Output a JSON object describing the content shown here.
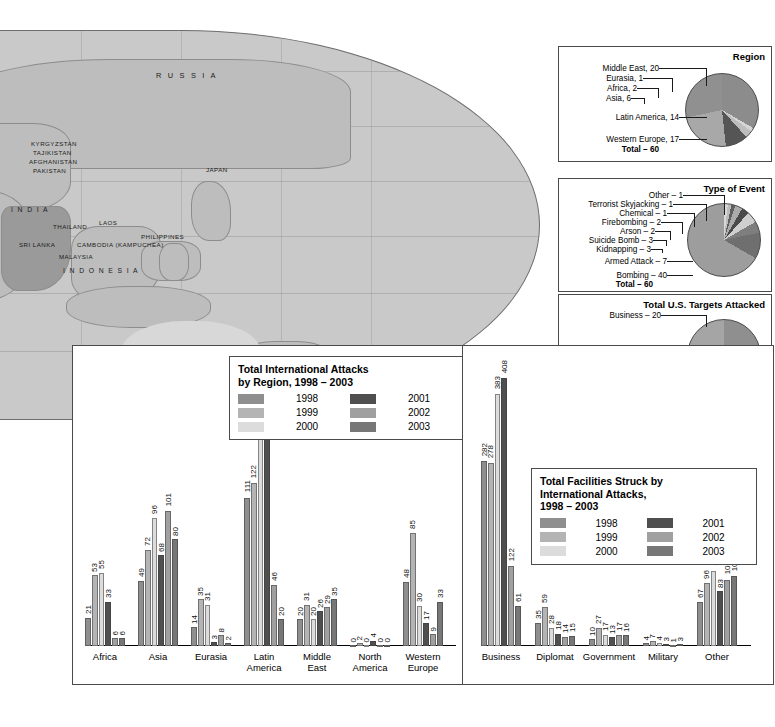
{
  "map": {
    "name": "world-map-eastern-hemisphere",
    "scale": {
      "miles": "2000 Miles",
      "kilometers": "3000 Kilometers"
    },
    "labels": [
      {
        "text": "RUSSIA",
        "x": 155,
        "y": 70,
        "cls": "big"
      },
      {
        "text": "BOSNIA AND",
        "x": -108,
        "y": 88,
        "cls": ""
      },
      {
        "text": "HERZEGOVINA",
        "x": -110,
        "y": 96,
        "cls": ""
      },
      {
        "text": "UKRAINE",
        "x": -106,
        "y": 109,
        "cls": ""
      },
      {
        "text": "YUGOSLAVIA",
        "x": -110,
        "y": 122,
        "cls": ""
      },
      {
        "text": "GREECE",
        "x": -104,
        "y": 135,
        "cls": ""
      },
      {
        "text": "GEORGIA",
        "x": -52,
        "y": 130,
        "cls": ""
      },
      {
        "text": "KYRGYZSTAN",
        "x": 30,
        "y": 139,
        "cls": ""
      },
      {
        "text": "TAJIKISTAN",
        "x": 32,
        "y": 148,
        "cls": ""
      },
      {
        "text": "AFGHANISTAN",
        "x": 28,
        "y": 157,
        "cls": ""
      },
      {
        "text": "PAKISTAN",
        "x": 32,
        "y": 166,
        "cls": ""
      },
      {
        "text": "LEBANON",
        "x": -118,
        "y": 163,
        "cls": ""
      },
      {
        "text": "JORDAN",
        "x": -116,
        "y": 176,
        "cls": ""
      },
      {
        "text": "IRAN",
        "x": -38,
        "y": 163,
        "cls": ""
      },
      {
        "text": "JAPAN",
        "x": 205,
        "y": 165,
        "cls": ""
      },
      {
        "text": "SAUDI",
        "x": -62,
        "y": 185,
        "cls": ""
      },
      {
        "text": "ARABIA",
        "x": -66,
        "y": 194,
        "cls": ""
      },
      {
        "text": "INDIA",
        "x": 10,
        "y": 205,
        "cls": "mid"
      },
      {
        "text": "SUDAN",
        "x": -118,
        "y": 205,
        "cls": ""
      },
      {
        "text": "YEMEN",
        "x": -64,
        "y": 205,
        "cls": ""
      },
      {
        "text": "THAILAND",
        "x": 52,
        "y": 222,
        "cls": ""
      },
      {
        "text": "LAOS",
        "x": 98,
        "y": 218,
        "cls": ""
      },
      {
        "text": "PHILIPPINES",
        "x": 140,
        "y": 232,
        "cls": ""
      },
      {
        "text": "ERITREA",
        "x": -120,
        "y": 230,
        "cls": ""
      },
      {
        "text": "SOMALIA",
        "x": -98,
        "y": 238,
        "cls": ""
      },
      {
        "text": "SRI LANKA",
        "x": 18,
        "y": 240,
        "cls": ""
      },
      {
        "text": "CAMBODIA (KAMPUCHEA)",
        "x": 76,
        "y": 240,
        "cls": ""
      },
      {
        "text": "UGANDA",
        "x": -104,
        "y": 248,
        "cls": ""
      },
      {
        "text": "MALAYSIA",
        "x": 58,
        "y": 252,
        "cls": ""
      },
      {
        "text": "KENYA",
        "x": -100,
        "y": 258,
        "cls": ""
      },
      {
        "text": "I N D O N E S I A",
        "x": 62,
        "y": 264,
        "cls": "mid"
      },
      {
        "text": "CONGO",
        "x": -122,
        "y": 262,
        "cls": ""
      },
      {
        "text": "BURUNDI",
        "x": -118,
        "y": 272,
        "cls": ""
      },
      {
        "text": "SOUTH",
        "x": -118,
        "y": 352,
        "cls": ""
      },
      {
        "text": "AFRICA",
        "x": -120,
        "y": 362,
        "cls": ""
      }
    ]
  },
  "region_pie": {
    "title": "Region",
    "total_label": "Total – 60",
    "slices": [
      {
        "label": "Middle East, 20",
        "value": 20,
        "color": "#8c8c8c"
      },
      {
        "label": "Eurasia, 1",
        "value": 1,
        "color": "#d5d5d5"
      },
      {
        "label": "Africa, 2",
        "value": 2,
        "color": "#bdbdbd"
      },
      {
        "label": "Asia, 6",
        "value": 6,
        "color": "#555555"
      },
      {
        "label": "Latin America, 14",
        "value": 14,
        "color": "#a8a8a8"
      },
      {
        "label": "Western Europe, 17",
        "value": 17,
        "color": "#909090"
      }
    ]
  },
  "event_pie": {
    "title": "Type of Event",
    "total_label": "Total – 60",
    "slices": [
      {
        "label": "Other – 1",
        "value": 1,
        "color": "#d8d8d8"
      },
      {
        "label": "Terrorist Skyjacking – 1",
        "value": 1,
        "color": "#bcbcbc"
      },
      {
        "label": "Chemical – 1",
        "value": 1,
        "color": "#606060"
      },
      {
        "label": "Firebombing – 2",
        "value": 2,
        "color": "#ababab"
      },
      {
        "label": "Arson – 2",
        "value": 2,
        "color": "#4a4a4a"
      },
      {
        "label": "Suicide Bomb – 3",
        "value": 3,
        "color": "#cfcfcf"
      },
      {
        "label": "Kidnapping – 3",
        "value": 3,
        "color": "#7e7e7e"
      },
      {
        "label": "Armed Attack – 7",
        "value": 7,
        "color": "#6f6f6f"
      },
      {
        "label": "Bombing – 40",
        "value": 40,
        "color": "#9d9d9d"
      }
    ]
  },
  "targets_pie": {
    "title": "Total U.S. Targets Attacked",
    "total_label": "Total – 84",
    "slices": [
      {
        "label": "Business – 20",
        "value": 20,
        "color": "#8f8f8f"
      },
      {
        "label": "Government – 7",
        "value": 7,
        "color": "#5e5e5e"
      },
      {
        "label": "Diplomat – 6",
        "value": 6,
        "color": "#cfcfcf"
      },
      {
        "label": "Military – 2",
        "value": 2,
        "color": "#7a7a7a"
      },
      {
        "label": "Other – 35",
        "value": 35,
        "color": "#a5a5a5"
      }
    ]
  },
  "attacks_legend": {
    "title_line1": "Total International Attacks",
    "title_line2": "by Region, 1998 – 2003",
    "entries": [
      {
        "year": "1998",
        "color": "#8f8f8f"
      },
      {
        "year": "2001",
        "color": "#4f4f4f"
      },
      {
        "year": "1999",
        "color": "#b4b4b4"
      },
      {
        "year": "2002",
        "color": "#a0a0a0"
      },
      {
        "year": "2000",
        "color": "#dcdcdc"
      },
      {
        "year": "2003",
        "color": "#777777"
      }
    ]
  },
  "facilities_legend": {
    "title_line1": "Total Facilities Struck by",
    "title_line2": "International Attacks,",
    "title_line3": "1998 – 2003",
    "entries": [
      {
        "year": "1998",
        "color": "#8f8f8f"
      },
      {
        "year": "2001",
        "color": "#4f4f4f"
      },
      {
        "year": "1999",
        "color": "#b4b4b4"
      },
      {
        "year": "2002",
        "color": "#a0a0a0"
      },
      {
        "year": "2000",
        "color": "#dcdcdc"
      },
      {
        "year": "2003",
        "color": "#777777"
      }
    ]
  },
  "chart_data": [
    {
      "type": "bar",
      "id": "attacks-by-region",
      "title": "Total International Attacks by Region, 1998 – 2003",
      "xlabel": "",
      "ylabel": "",
      "ylim": [
        0,
        201
      ],
      "grid": false,
      "legend_position": "inside-top-right",
      "categories": [
        "Africa",
        "Asia",
        "Eurasia",
        "Latin\nAmerica",
        "Middle\nEast",
        "North\nAmerica",
        "Western\nEurope"
      ],
      "series": [
        {
          "name": "1998",
          "color": "#8f8f8f",
          "values": [
            21,
            49,
            14,
            111,
            20,
            0,
            48
          ]
        },
        {
          "name": "1999",
          "color": "#b4b4b4",
          "values": [
            53,
            72,
            35,
            122,
            31,
            2,
            85
          ]
        },
        {
          "name": "2000",
          "color": "#dcdcdc",
          "values": [
            55,
            96,
            31,
            192,
            20,
            0,
            30
          ]
        },
        {
          "name": "2001",
          "color": "#4f4f4f",
          "values": [
            33,
            68,
            3,
            201,
            26,
            4,
            17
          ]
        },
        {
          "name": "2002",
          "color": "#a0a0a0",
          "values": [
            6,
            101,
            8,
            46,
            29,
            0,
            9
          ]
        },
        {
          "name": "2003",
          "color": "#777777",
          "values": [
            6,
            80,
            2,
            20,
            35,
            0,
            33
          ]
        }
      ]
    },
    {
      "type": "bar",
      "id": "facilities-struck",
      "title": "Total Facilities Struck by International Attacks, 1998 – 2003",
      "xlabel": "",
      "ylabel": "",
      "ylim": [
        0,
        408
      ],
      "grid": false,
      "legend_position": "inside-mid-right",
      "categories": [
        "Business",
        "Diplomat",
        "Government",
        "Military",
        "Other"
      ],
      "series": [
        {
          "name": "1998",
          "color": "#8f8f8f",
          "values": [
            282,
            35,
            10,
            4,
            67
          ]
        },
        {
          "name": "1999",
          "color": "#b4b4b4",
          "values": [
            278,
            59,
            27,
            7,
            96
          ]
        },
        {
          "name": "2000",
          "color": "#dcdcdc",
          "values": [
            383,
            28,
            17,
            4,
            114
          ]
        },
        {
          "name": "2001",
          "color": "#4f4f4f",
          "values": [
            408,
            18,
            13,
            3,
            83
          ]
        },
        {
          "name": "2002",
          "color": "#a0a0a0",
          "values": [
            122,
            14,
            17,
            1,
            101
          ]
        },
        {
          "name": "2003",
          "color": "#777777",
          "values": [
            61,
            15,
            16,
            3,
            106
          ]
        }
      ]
    }
  ]
}
